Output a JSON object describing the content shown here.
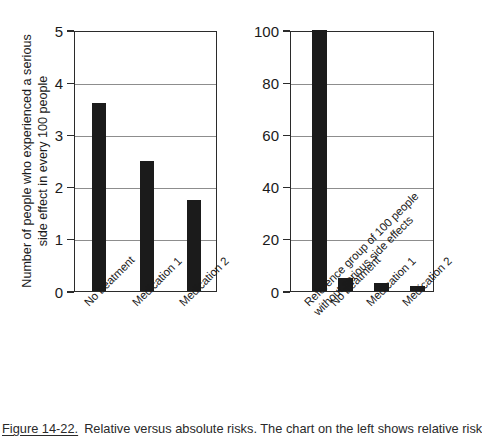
{
  "figure": {
    "number": "Figure 14-22.",
    "text": "Relative versus absolute risks. The chart on the left shows relative risk"
  },
  "chart_data": [
    {
      "type": "bar",
      "title": "",
      "panel": "left",
      "xlabel": "",
      "ylabel": "Number of people who experienced a serious\nside effect in every 100 people",
      "categories": [
        "No treatment",
        "Medication 1",
        "Medication 2"
      ],
      "values": [
        3.6,
        2.5,
        1.75
      ],
      "ylim": [
        0,
        5
      ],
      "yticks": [
        0,
        1,
        2,
        3,
        4,
        5
      ],
      "yticklabels": [
        "0",
        "1",
        "2",
        "3",
        "4",
        "5"
      ],
      "grid": true,
      "legend": false,
      "bar_color": "#1b1b1b"
    },
    {
      "type": "bar",
      "title": "",
      "panel": "right",
      "xlabel": "",
      "ylabel": "",
      "categories": [
        "Reference group of 100 people\nwithout serious side effects",
        "No treatment",
        "Medication 1",
        "Medication 2"
      ],
      "values": [
        100,
        5,
        3,
        2
      ],
      "ylim": [
        0,
        100
      ],
      "yticks": [
        0,
        20,
        40,
        60,
        80,
        100
      ],
      "yticklabels": [
        "0",
        "20",
        "40",
        "60",
        "80",
        "100"
      ],
      "grid": true,
      "legend": false,
      "bar_color": "#1b1b1b"
    }
  ]
}
